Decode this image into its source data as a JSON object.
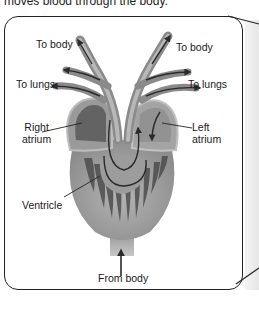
{
  "caption": "moves blood through the body.",
  "diagram": {
    "labels": {
      "to_body_left": "To body",
      "to_body_right": "To body",
      "to_lungs_left": "To lungs",
      "to_lungs_right": "To lungs",
      "right_atrium_line1": "Right",
      "right_atrium_line2": "atrium",
      "left_atrium_line1": "Left",
      "left_atrium_line2": "atrium",
      "ventricle": "Ventricle",
      "from_body": "From body"
    },
    "colors": {
      "heart_fill": "#a0a0a0",
      "heart_dark": "#4a4a4a",
      "vessel": "#8a8a8a",
      "arrow": "#2a2a2a",
      "frame": "#222222"
    }
  }
}
